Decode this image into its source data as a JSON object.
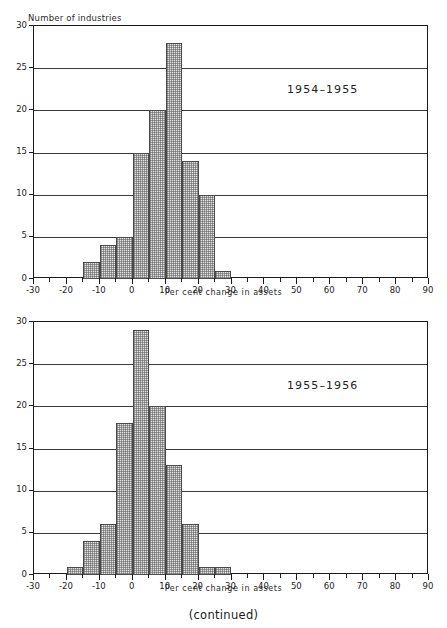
{
  "figure": {
    "continued_note": "(continued)",
    "ink_color": "#1a1a1a",
    "bar_fill_color": "#e4e4e4",
    "bar_edge_color": "#4a4a4a",
    "background_color": "#ffffff"
  },
  "panels": [
    {
      "id": "panel-1954-1955",
      "series_label": "1954–1955",
      "ylabel": "Number of industries",
      "xlabel": "Per cent change in assets",
      "ytick_labels": [
        "0",
        "5",
        "10",
        "15",
        "20",
        "25",
        "30"
      ],
      "xtick_labels": [
        "-30",
        "-20",
        "-10",
        "0",
        "10",
        "20",
        "30",
        "40",
        "50",
        "60",
        "70",
        "80",
        "90"
      ]
    },
    {
      "id": "panel-1955-1956",
      "series_label": "1955–1956",
      "ylabel": "",
      "xlabel": "Per cent change in assets",
      "ytick_labels": [
        "0",
        "5",
        "10",
        "15",
        "20",
        "25",
        "30"
      ],
      "xtick_labels": [
        "-30",
        "-20",
        "-10",
        "0",
        "10",
        "20",
        "30",
        "40",
        "50",
        "60",
        "70",
        "80",
        "90"
      ]
    }
  ],
  "chart_data": [
    {
      "type": "bar",
      "subtype": "histogram",
      "title": "1954–1955",
      "xlabel": "Per cent change in assets",
      "ylabel": "Number of industries",
      "xlim": [
        -30,
        90
      ],
      "ylim": [
        0,
        30
      ],
      "xticks": [
        -30,
        -20,
        -10,
        0,
        10,
        20,
        30,
        40,
        50,
        60,
        70,
        80,
        90
      ],
      "yticks": [
        0,
        5,
        10,
        15,
        20,
        25,
        30
      ],
      "xtick_minor_step": 5,
      "grid": "horizontal",
      "legend": "none",
      "bin_width": 5,
      "bin_edges": [
        -15,
        -10,
        -5,
        0,
        5,
        10,
        15,
        20,
        25,
        30
      ],
      "categories": [
        "-15 to -10",
        "-10 to -5",
        "-5 to 0",
        "0 to 5",
        "5 to 10",
        "10 to 15",
        "15 to 20",
        "20 to 25",
        "25 to 30"
      ],
      "values": [
        2,
        4,
        5,
        15,
        20,
        28,
        14,
        10,
        1
      ]
    },
    {
      "type": "bar",
      "subtype": "histogram",
      "title": "1955–1956",
      "xlabel": "Per cent change in assets",
      "ylabel": "Number of industries",
      "xlim": [
        -30,
        90
      ],
      "ylim": [
        0,
        30
      ],
      "xticks": [
        -30,
        -20,
        -10,
        0,
        10,
        20,
        30,
        40,
        50,
        60,
        70,
        80,
        90
      ],
      "yticks": [
        0,
        5,
        10,
        15,
        20,
        25,
        30
      ],
      "xtick_minor_step": 5,
      "grid": "horizontal",
      "legend": "none",
      "bin_width": 5,
      "bin_edges": [
        -20,
        -15,
        -10,
        -5,
        0,
        5,
        10,
        15,
        20,
        25,
        30
      ],
      "categories": [
        "-20 to -15",
        "-15 to -10",
        "-10 to -5",
        "-5 to 0",
        "0 to 5",
        "5 to 10",
        "10 to 15",
        "15 to 20",
        "20 to 25",
        "25 to 30"
      ],
      "values": [
        1,
        4,
        6,
        18,
        29,
        20,
        13,
        6,
        1,
        1
      ]
    }
  ]
}
